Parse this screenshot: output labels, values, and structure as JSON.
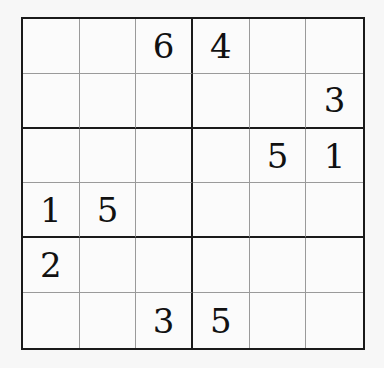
{
  "puzzle": {
    "type": "sudoku-6x6",
    "box_rows": 2,
    "box_cols": 3,
    "grid": [
      [
        "",
        "",
        "6",
        "4",
        "",
        ""
      ],
      [
        "",
        "",
        "",
        "",
        "",
        "3"
      ],
      [
        "",
        "",
        "",
        "",
        "5",
        "1"
      ],
      [
        "1",
        "5",
        "",
        "",
        "",
        ""
      ],
      [
        "2",
        "",
        "",
        "",
        "",
        ""
      ],
      [
        "",
        "",
        "3",
        "5",
        "",
        ""
      ]
    ]
  }
}
